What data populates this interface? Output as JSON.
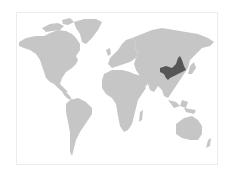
{
  "map": {
    "type": "world-locator-map",
    "projection": "Miller-like (Antarctica omitted)",
    "colors": {
      "background": "#ffffff",
      "frame": "#ececec",
      "land": "#c6c6c6",
      "highlight": "#565656"
    },
    "highlighted_region": {
      "name": "Inner Mongolia / Northern China",
      "continent": "Asia"
    },
    "continents": [
      "North America",
      "Greenland",
      "South America",
      "Europe",
      "Africa",
      "Asia",
      "Australia"
    ]
  }
}
